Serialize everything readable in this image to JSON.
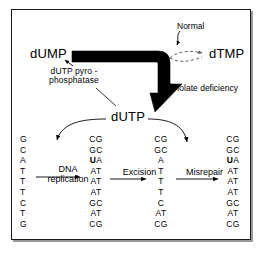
{
  "figure": {
    "molecules": {
      "dump": "dUMP",
      "dtmp": "dTMP",
      "dutp": "dUTP"
    },
    "annotations": {
      "enzyme": "dUTP pyro-\nphosphatase",
      "enzyme_line1": "dUTP pyro -",
      "enzyme_line2": "phosphatase",
      "normal": "Normal",
      "folate_deficiency": "folate deficiency"
    },
    "processes": {
      "dna_replication_line1": "DNA",
      "dna_replication_line2": "replication",
      "excision": "Excision",
      "misrepair": "Misrepair"
    },
    "sequences": [
      {
        "id": "template-strand",
        "rows": [
          {
            "text": "G",
            "bold": false
          },
          {
            "text": "C",
            "bold": false
          },
          {
            "text": "A",
            "bold": false
          },
          {
            "text": "T",
            "bold": false
          },
          {
            "text": "T",
            "bold": false
          },
          {
            "text": "T",
            "bold": false
          },
          {
            "text": "C",
            "bold": false
          },
          {
            "text": "T",
            "bold": false
          },
          {
            "text": "G",
            "bold": false
          }
        ]
      },
      {
        "id": "after-replication",
        "rows": [
          {
            "text": "CG",
            "bold": false
          },
          {
            "text": "GC",
            "bold": false
          },
          {
            "text": "UA",
            "bold": true
          },
          {
            "text": "AT",
            "bold": false
          },
          {
            "text": "AT",
            "bold": false
          },
          {
            "text": "AT",
            "bold": false
          },
          {
            "text": "GC",
            "bold": false
          },
          {
            "text": "AT",
            "bold": false
          },
          {
            "text": "CG",
            "bold": false
          }
        ]
      },
      {
        "id": "after-excision",
        "rows": [
          {
            "text": "CG",
            "bold": false
          },
          {
            "text": "GC",
            "bold": false
          },
          {
            "text": "A",
            "bold": false
          },
          {
            "text": "T",
            "bold": false
          },
          {
            "text": "T",
            "bold": false
          },
          {
            "text": "T",
            "bold": false
          },
          {
            "text": "C",
            "bold": false
          },
          {
            "text": "AT",
            "bold": false
          },
          {
            "text": "CG",
            "bold": false
          }
        ]
      },
      {
        "id": "after-misrepair",
        "rows": [
          {
            "text": "CG",
            "bold": false
          },
          {
            "text": "GC",
            "bold": false
          },
          {
            "text": "UA",
            "bold": true
          },
          {
            "text": "AT",
            "bold": false
          },
          {
            "text": "AT",
            "bold": false
          },
          {
            "text": "AT",
            "bold": false
          },
          {
            "text": "GC",
            "bold": false
          },
          {
            "text": "AT",
            "bold": false
          },
          {
            "text": "CG",
            "bold": false
          }
        ]
      }
    ],
    "colors": {
      "ink": "#000000",
      "paper": "#ffffff",
      "border": "#1a1a1a",
      "shadow": "#9a9a9a"
    }
  }
}
